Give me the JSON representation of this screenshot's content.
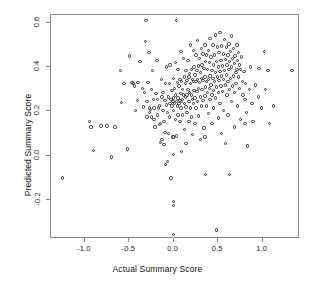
{
  "chart_data": {
    "type": "scatter",
    "title": "",
    "xlabel": "Actual Summary Score",
    "ylabel": "Predicted Summary Score",
    "xlim": [
      -1.38,
      1.42
    ],
    "ylim": [
      -0.375,
      0.635
    ],
    "xticks": [
      -1.0,
      -0.5,
      0.0,
      0.5,
      1.0
    ],
    "xticklabels": [
      "-1.0",
      "-0.5",
      "0.0",
      "0.5",
      "1.0"
    ],
    "yticks": [
      -0.2,
      0.0,
      0.2,
      0.4,
      0.6
    ],
    "yticklabels": [
      "-0.2",
      "0.0",
      "0.2",
      "0.4",
      "0.6"
    ],
    "grid": false,
    "legend": null,
    "marker": "open-circle",
    "marker_color": "#2e2e2e",
    "n_points": 284,
    "points": [
      [
        -1.25,
        -0.1
      ],
      [
        -0.95,
        0.155
      ],
      [
        -0.93,
        0.13
      ],
      [
        -0.9,
        0.025
      ],
      [
        -0.82,
        0.135
      ],
      [
        -0.75,
        0.135
      ],
      [
        -0.7,
        -0.005
      ],
      [
        -0.66,
        0.13
      ],
      [
        -0.6,
        0.385
      ],
      [
        -0.59,
        0.24
      ],
      [
        -0.56,
        0.325
      ],
      [
        -0.52,
        0.03
      ],
      [
        -0.5,
        0.45
      ],
      [
        -0.47,
        0.33
      ],
      [
        -0.46,
        0.325
      ],
      [
        -0.44,
        0.315
      ],
      [
        -0.43,
        0.205
      ],
      [
        -0.41,
        0.25
      ],
      [
        -0.4,
        0.33
      ],
      [
        -0.38,
        0.425
      ],
      [
        -0.35,
        0.305
      ],
      [
        -0.34,
        0.22
      ],
      [
        -0.33,
        0.285
      ],
      [
        -0.32,
        0.515
      ],
      [
        -0.31,
        0.61
      ],
      [
        -0.3,
        0.245
      ],
      [
        -0.3,
        0.175
      ],
      [
        -0.29,
        0.33
      ],
      [
        -0.28,
        0.465
      ],
      [
        -0.27,
        0.215
      ],
      [
        -0.27,
        0.195
      ],
      [
        -0.26,
        0.21
      ],
      [
        -0.25,
        0.3
      ],
      [
        -0.25,
        0.175
      ],
      [
        -0.24,
        0.385
      ],
      [
        -0.23,
        0.255
      ],
      [
        -0.22,
        0.165
      ],
      [
        -0.22,
        0.215
      ],
      [
        -0.21,
        0.13
      ],
      [
        -0.2,
        0.28
      ],
      [
        -0.19,
        0.43
      ],
      [
        -0.18,
        0.255
      ],
      [
        -0.18,
        0.185
      ],
      [
        -0.17,
        0.215
      ],
      [
        -0.16,
        0.14
      ],
      [
        -0.16,
        0.225
      ],
      [
        -0.15,
        0.06
      ],
      [
        -0.15,
        0.145
      ],
      [
        -0.14,
        0.345
      ],
      [
        -0.13,
        0.265
      ],
      [
        -0.13,
        0.075
      ],
      [
        -0.12,
        0.205
      ],
      [
        -0.12,
        0.285
      ],
      [
        -0.11,
        0.155
      ],
      [
        -0.11,
        0.05
      ],
      [
        -0.1,
        0.25
      ],
      [
        -0.1,
        0.105
      ],
      [
        -0.09,
        0.325
      ],
      [
        -0.09,
        -0.04
      ],
      [
        -0.08,
        0.23
      ],
      [
        -0.08,
        0.4
      ],
      [
        -0.07,
        -0.025
      ],
      [
        -0.07,
        0.195
      ],
      [
        -0.06,
        0.265
      ],
      [
        -0.06,
        0.1
      ],
      [
        -0.05,
        0.325
      ],
      [
        -0.05,
        0.175
      ],
      [
        -0.04,
        0.235
      ],
      [
        -0.04,
        0.41
      ],
      [
        -0.03,
        0.255
      ],
      [
        -0.03,
        -0.1
      ],
      [
        -0.02,
        0.225
      ],
      [
        -0.02,
        0.295
      ],
      [
        -0.01,
        0.245
      ],
      [
        -0.01,
        0.085
      ],
      [
        0.0,
        0.35
      ],
      [
        0.0,
        0.26
      ],
      [
        0.0,
        0.205
      ],
      [
        0.0,
        0.085
      ],
      [
        0.0,
        0.005
      ],
      [
        0.0,
        -0.205
      ],
      [
        0.0,
        -0.225
      ],
      [
        0.0,
        -0.355
      ],
      [
        0.01,
        0.305
      ],
      [
        0.01,
        0.235
      ],
      [
        0.02,
        0.42
      ],
      [
        0.02,
        0.275
      ],
      [
        0.02,
        0.165
      ],
      [
        0.03,
        0.61
      ],
      [
        0.03,
        0.245
      ],
      [
        0.03,
        0.09
      ],
      [
        0.04,
        0.33
      ],
      [
        0.04,
        0.225
      ],
      [
        0.05,
        0.39
      ],
      [
        0.05,
        0.26
      ],
      [
        0.05,
        0.185
      ],
      [
        0.06,
        0.315
      ],
      [
        0.06,
        0.235
      ],
      [
        0.07,
        0.345
      ],
      [
        0.07,
        0.25
      ],
      [
        0.07,
        0.155
      ],
      [
        0.08,
        0.47
      ],
      [
        0.08,
        0.28
      ],
      [
        0.08,
        0.215
      ],
      [
        0.09,
        0.335
      ],
      [
        0.09,
        0.245
      ],
      [
        0.09,
        0.02
      ],
      [
        0.1,
        0.3
      ],
      [
        0.1,
        0.255
      ],
      [
        0.1,
        0.185
      ],
      [
        0.11,
        0.44
      ],
      [
        0.11,
        0.275
      ],
      [
        0.12,
        0.355
      ],
      [
        0.12,
        0.235
      ],
      [
        0.12,
        0.12
      ],
      [
        0.13,
        0.325
      ],
      [
        0.13,
        0.265
      ],
      [
        0.14,
        0.385
      ],
      [
        0.14,
        0.22
      ],
      [
        0.14,
        0.055
      ],
      [
        0.15,
        0.34
      ],
      [
        0.15,
        0.275
      ],
      [
        0.15,
        0.195
      ],
      [
        0.16,
        0.43
      ],
      [
        0.16,
        0.3
      ],
      [
        0.17,
        0.355
      ],
      [
        0.17,
        0.245
      ],
      [
        0.17,
        0.155
      ],
      [
        0.18,
        0.37
      ],
      [
        0.18,
        0.285
      ],
      [
        0.19,
        0.5
      ],
      [
        0.19,
        0.325
      ],
      [
        0.19,
        0.215
      ],
      [
        0.2,
        0.39
      ],
      [
        0.2,
        0.275
      ],
      [
        0.2,
        0.175
      ],
      [
        0.21,
        0.345
      ],
      [
        0.21,
        0.255
      ],
      [
        0.21,
        0.095
      ],
      [
        0.22,
        0.475
      ],
      [
        0.22,
        0.335
      ],
      [
        0.22,
        0.235
      ],
      [
        0.23,
        0.4
      ],
      [
        0.23,
        0.295
      ],
      [
        0.24,
        0.365
      ],
      [
        0.24,
        0.26
      ],
      [
        0.24,
        0.145
      ],
      [
        0.25,
        0.455
      ],
      [
        0.25,
        0.335
      ],
      [
        0.25,
        0.215
      ],
      [
        0.26,
        0.385
      ],
      [
        0.26,
        0.29
      ],
      [
        0.27,
        0.52
      ],
      [
        0.27,
        0.345
      ],
      [
        0.27,
        0.245
      ],
      [
        0.28,
        0.405
      ],
      [
        0.28,
        0.305
      ],
      [
        0.28,
        0.18
      ],
      [
        0.29,
        0.44
      ],
      [
        0.29,
        0.33
      ],
      [
        0.3,
        0.375
      ],
      [
        0.3,
        0.265
      ],
      [
        0.3,
        0.075
      ],
      [
        0.31,
        0.485
      ],
      [
        0.31,
        0.35
      ],
      [
        0.31,
        0.225
      ],
      [
        0.32,
        0.41
      ],
      [
        0.32,
        0.3
      ],
      [
        0.33,
        0.46
      ],
      [
        0.33,
        0.34
      ],
      [
        0.33,
        0.25
      ],
      [
        0.34,
        0.395
      ],
      [
        0.34,
        0.125
      ],
      [
        0.35,
        0.5
      ],
      [
        0.35,
        0.355
      ],
      [
        0.35,
        0.27
      ],
      [
        0.35,
        0.085
      ],
      [
        0.36,
        0.425
      ],
      [
        0.36,
        0.31
      ],
      [
        0.36,
        -0.085
      ],
      [
        0.37,
        0.455
      ],
      [
        0.37,
        0.335
      ],
      [
        0.37,
        0.225
      ],
      [
        0.38,
        0.39
      ],
      [
        0.38,
        0.285
      ],
      [
        0.39,
        0.475
      ],
      [
        0.39,
        0.345
      ],
      [
        0.39,
        0.19
      ],
      [
        0.4,
        0.42
      ],
      [
        0.4,
        0.305
      ],
      [
        0.41,
        0.53
      ],
      [
        0.41,
        0.36
      ],
      [
        0.41,
        0.255
      ],
      [
        0.42,
        0.445
      ],
      [
        0.42,
        0.32
      ],
      [
        0.43,
        0.385
      ],
      [
        0.43,
        0.275
      ],
      [
        0.43,
        0.145
      ],
      [
        0.44,
        0.5
      ],
      [
        0.44,
        0.35
      ],
      [
        0.45,
        0.41
      ],
      [
        0.45,
        0.295
      ],
      [
        0.45,
        0.215
      ],
      [
        0.46,
        0.455
      ],
      [
        0.46,
        0.335
      ],
      [
        0.47,
        0.545
      ],
      [
        0.47,
        0.375
      ],
      [
        0.47,
        0.26
      ],
      [
        0.48,
        0.425
      ],
      [
        0.48,
        0.31
      ],
      [
        0.48,
        -0.335
      ],
      [
        0.49,
        0.49
      ],
      [
        0.49,
        0.355
      ],
      [
        0.5,
        0.4
      ],
      [
        0.5,
        0.285
      ],
      [
        0.5,
        0.17
      ],
      [
        0.51,
        0.465
      ],
      [
        0.51,
        0.34
      ],
      [
        0.52,
        0.555
      ],
      [
        0.52,
        0.38
      ],
      [
        0.52,
        0.235
      ],
      [
        0.53,
        0.43
      ],
      [
        0.53,
        0.315
      ],
      [
        0.54,
        0.495
      ],
      [
        0.54,
        0.36
      ],
      [
        0.54,
        0.1
      ],
      [
        0.55,
        0.405
      ],
      [
        0.55,
        0.29
      ],
      [
        0.56,
        0.46
      ],
      [
        0.56,
        0.345
      ],
      [
        0.56,
        0.205
      ],
      [
        0.57,
        0.525
      ],
      [
        0.57,
        0.385
      ],
      [
        0.58,
        0.435
      ],
      [
        0.58,
        0.32
      ],
      [
        0.58,
        0.055
      ],
      [
        0.59,
        0.49
      ],
      [
        0.59,
        0.365
      ],
      [
        0.6,
        0.41
      ],
      [
        0.6,
        0.275
      ],
      [
        0.61,
        0.455
      ],
      [
        0.61,
        0.335
      ],
      [
        0.61,
        0.185
      ],
      [
        0.62,
        0.505
      ],
      [
        0.62,
        0.39
      ],
      [
        0.63,
        0.425
      ],
      [
        0.63,
        0.3
      ],
      [
        0.63,
        -0.085
      ],
      [
        0.64,
        0.47
      ],
      [
        0.64,
        0.35
      ],
      [
        0.65,
        0.54
      ],
      [
        0.65,
        0.4
      ],
      [
        0.65,
        0.245
      ],
      [
        0.66,
        0.44
      ],
      [
        0.66,
        0.315
      ],
      [
        0.67,
        0.485
      ],
      [
        0.67,
        0.36
      ],
      [
        0.68,
        0.415
      ],
      [
        0.68,
        0.285
      ],
      [
        0.68,
        0.13
      ],
      [
        0.69,
        0.45
      ],
      [
        0.7,
        0.375
      ],
      [
        0.7,
        0.325
      ],
      [
        0.71,
        0.5
      ],
      [
        0.71,
        0.39
      ],
      [
        0.72,
        0.43
      ],
      [
        0.72,
        0.225
      ],
      [
        0.73,
        0.465
      ],
      [
        0.73,
        0.355
      ],
      [
        0.74,
        0.41
      ],
      [
        0.74,
        0.305
      ],
      [
        0.75,
        0.39
      ],
      [
        0.75,
        0.165
      ],
      [
        0.76,
        0.445
      ],
      [
        0.77,
        0.335
      ],
      [
        0.78,
        0.275
      ],
      [
        0.79,
        0.38
      ],
      [
        0.8,
        0.255
      ],
      [
        0.8,
        0.145
      ],
      [
        0.81,
        0.325
      ],
      [
        0.82,
        0.195
      ],
      [
        0.83,
        0.045
      ],
      [
        0.85,
        0.3
      ],
      [
        0.86,
        0.4
      ],
      [
        0.88,
        0.235
      ],
      [
        0.89,
        0.155
      ],
      [
        0.92,
        0.32
      ],
      [
        0.95,
        0.265
      ],
      [
        0.96,
        0.395
      ],
      [
        0.99,
        0.215
      ],
      [
        1.02,
        0.47
      ],
      [
        1.03,
        0.3
      ],
      [
        1.06,
        0.385
      ],
      [
        1.08,
        0.145
      ],
      [
        1.12,
        0.225
      ],
      [
        1.33,
        0.385
      ]
    ]
  }
}
